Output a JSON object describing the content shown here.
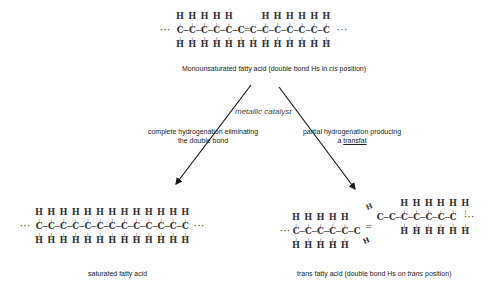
{
  "diagram": {
    "top_molecule": {
      "name": "monounsaturated-fatty-acid",
      "carbons": 13,
      "top_h": [
        "H",
        "H",
        "H",
        "H",
        "H",
        "",
        "",
        "H",
        "H",
        "H",
        "H",
        "H",
        "H"
      ],
      "backbone": "··· C−C−C−C−C−C=C−C−C−C−C−C−C ···",
      "bottom_h": [
        "H",
        "H",
        "H",
        "H",
        "H",
        "H",
        "H",
        "H",
        "H",
        "H",
        "H",
        "H",
        "H"
      ],
      "label_prefix": "Monounsaturated fatty acid (double bond Hs in ",
      "label_italic": "cis",
      "label_suffix": " position)"
    },
    "catalyst_label": "metallic catalyst",
    "left_path": {
      "line1": "complete hydrogenation eliminating",
      "line2": "the double bond"
    },
    "right_path": {
      "line1": "partial hydrogenation producing",
      "line2_prefix": "a ",
      "line2_underlined": "transfat"
    },
    "bottom_left_molecule": {
      "name": "saturated-fatty-acid",
      "carbons": 13,
      "top_h": [
        "H",
        "H",
        "H",
        "H",
        "H",
        "H",
        "H",
        "H",
        "H",
        "H",
        "H",
        "H",
        "H"
      ],
      "bottom_h": [
        "H",
        "H",
        "H",
        "H",
        "H",
        "H",
        "H",
        "H",
        "H",
        "H",
        "H",
        "H",
        "H"
      ],
      "label": "saturated fatty acid"
    },
    "bottom_right_molecule": {
      "name": "trans-fatty-acid",
      "carbons": 13,
      "left_chain_h": [
        "H",
        "H",
        "H",
        "H",
        "H"
      ],
      "right_chain_h": [
        "H",
        "H",
        "H",
        "H",
        "H",
        "H"
      ],
      "diagonal_h": [
        "H",
        "H"
      ],
      "label_prefix": "trans fatty acid (double bond Hs on ",
      "label_italic": "trans",
      "label_suffix": " position)"
    },
    "ellipsis": "···",
    "carbon": "C",
    "hydrogen": "H",
    "arrow_color": "#1a1a1a"
  }
}
